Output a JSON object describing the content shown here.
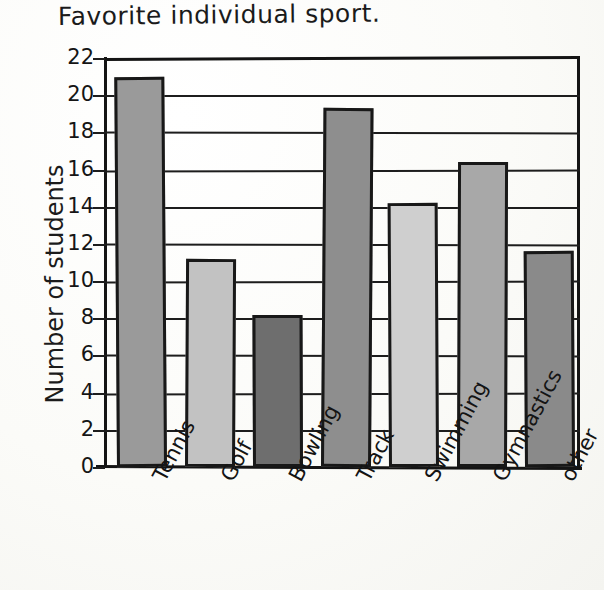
{
  "chart_data": {
    "type": "bar",
    "title": "Favorite individual sport.",
    "xlabel": "",
    "ylabel": "Number of students",
    "categories": [
      "Tennis",
      "Golf",
      "Bowling",
      "Track",
      "Swimming",
      "Gymnastics",
      "other"
    ],
    "values": [
      21,
      11.2,
      8.2,
      19.3,
      14.2,
      16.4,
      11.6
    ],
    "ylim": [
      0,
      22
    ],
    "ytick_labels": [
      "22",
      "20",
      "18",
      "16",
      "14",
      "12",
      "10",
      "8",
      "6",
      "4",
      "2",
      "0"
    ],
    "ytick_values": [
      22,
      20,
      18,
      16,
      14,
      12,
      10,
      8,
      6,
      4,
      2,
      0
    ],
    "grid": true,
    "legend": "none",
    "bar_colors": [
      "#9a9a9a",
      "#c2c2c2",
      "#6e6e6e",
      "#8e8e8e",
      "#cfcfcf",
      "#a8a8a8",
      "#8a8a8a"
    ],
    "style": "hand-drawn"
  }
}
